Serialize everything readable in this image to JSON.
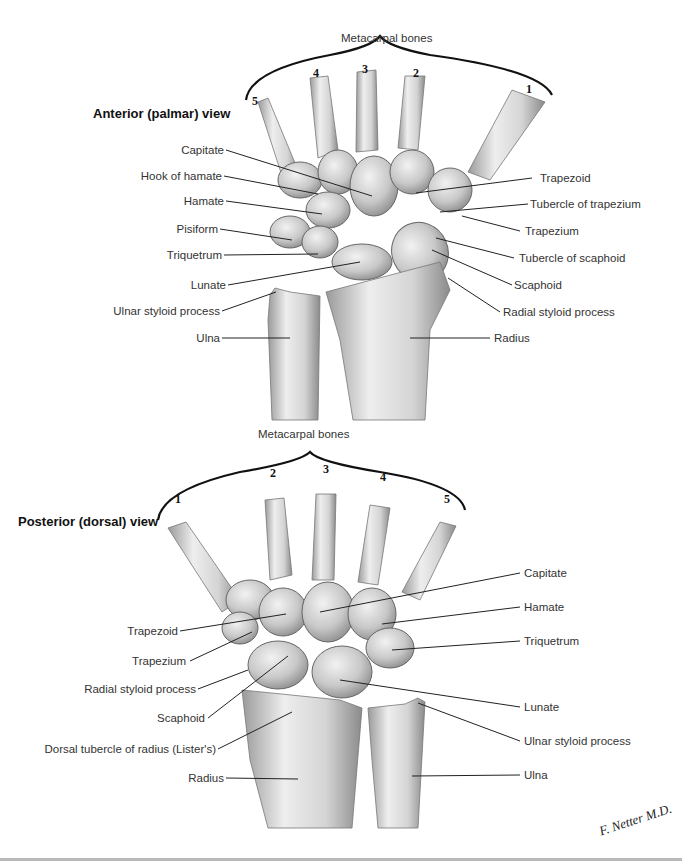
{
  "anterior": {
    "title": "Anterior (palmar) view",
    "metacarpal_group_label": "Metacarpal bones",
    "metacarpal_numbers": [
      "5",
      "4",
      "3",
      "2",
      "1"
    ],
    "left_labels": [
      "Capitate",
      "Hook of hamate",
      "Hamate",
      "Pisiform",
      "Triquetrum",
      "Lunate",
      "Ulnar styloid process",
      "Ulna"
    ],
    "right_labels": [
      "Trapezoid",
      "Tubercle of trapezium",
      "Trapezium",
      "Tubercle of scaphoid",
      "Scaphoid",
      "Radial styloid process",
      "Radius"
    ]
  },
  "posterior": {
    "title": "Posterior (dorsal) view",
    "metacarpal_group_label": "Metacarpal bones",
    "metacarpal_numbers": [
      "1",
      "2",
      "3",
      "4",
      "5"
    ],
    "left_labels": [
      "Trapezoid",
      "Trapezium",
      "Radial styloid process",
      "Scaphoid",
      "Dorsal tubercle of radius (Lister's)",
      "Radius"
    ],
    "right_labels": [
      "Capitate",
      "Hamate",
      "Triquetrum",
      "Lunate",
      "Ulnar styloid process",
      "Ulna"
    ]
  },
  "signature": "F. Netter M.D.",
  "colors": {
    "bone_light": "#ececec",
    "bone_mid": "#c9c9c9",
    "bone_shadow": "#8f8f8f",
    "leader_line": "#222222",
    "text": "#333333"
  }
}
